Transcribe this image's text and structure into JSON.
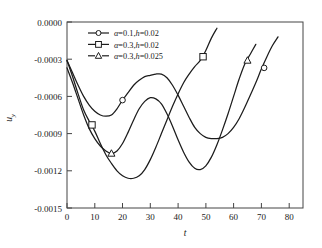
{
  "chart_data": {
    "type": "line",
    "title": "",
    "xlabel": "t",
    "ylabel": "u_y",
    "xlim": [
      0,
      85
    ],
    "ylim": [
      -0.0015,
      0.0
    ],
    "grid": false,
    "legend_position": "top-left-inside",
    "x_ticks": [
      0,
      10,
      20,
      30,
      40,
      50,
      60,
      70,
      80
    ],
    "x_tick_labels": [
      "0",
      "10",
      "20",
      "30",
      "40",
      "50",
      "60",
      "70",
      "80"
    ],
    "y_ticks": [
      0.0,
      -0.0003,
      -0.0006,
      -0.0009,
      -0.0012,
      -0.0015
    ],
    "y_tick_labels": [
      "0.0000",
      "-0.0003",
      "-0.0006",
      "-0.0009",
      "-0.0012",
      "-0.0015"
    ],
    "series": [
      {
        "name": "alpha=0.1,h=0.02",
        "label_alpha": "α",
        "label_alpha_value": "=0.1,",
        "label_h": "h",
        "label_h_value": "=0.02",
        "marker": "circle",
        "linestyle": "solid",
        "color": "#1c1c1c",
        "x": [
          0,
          2,
          4,
          6,
          8,
          10,
          12,
          14,
          16,
          18,
          20,
          22,
          24,
          26,
          28,
          30,
          32,
          34,
          36,
          38,
          40,
          42,
          44,
          46,
          48,
          50,
          52,
          54,
          56,
          58,
          60,
          62,
          64,
          66,
          68,
          70,
          72,
          74,
          76
        ],
        "y": [
          -0.00031,
          -0.00041,
          -0.00051,
          -0.0006,
          -0.00067,
          -0.00072,
          -0.00075,
          -0.00076,
          -0.00075,
          -0.0007,
          -0.00063,
          -0.00057,
          -0.00051,
          -0.00047,
          -0.00044,
          -0.00043,
          -0.00042,
          -0.00042,
          -0.00045,
          -0.00051,
          -0.00059,
          -0.00068,
          -0.00077,
          -0.00085,
          -0.0009,
          -0.00093,
          -0.00094,
          -0.00094,
          -0.00093,
          -0.0009,
          -0.00085,
          -0.00078,
          -0.00069,
          -0.00059,
          -0.00049,
          -0.00038,
          -0.00028,
          -0.00019,
          -0.00012
        ],
        "markers_x": [
          20,
          71
        ],
        "markers_y": [
          -0.00063,
          -0.00037
        ]
      },
      {
        "name": "alpha=0.3,h=0.02",
        "label_alpha": "α",
        "label_alpha_value": "=0.3,",
        "label_h": "h",
        "label_h_value": "=0.02",
        "marker": "square",
        "linestyle": "solid",
        "color": "#1c1c1c",
        "x": [
          0,
          2,
          4,
          6,
          8,
          10,
          12,
          14,
          16,
          18,
          20,
          22,
          24,
          26,
          28,
          30,
          32,
          34,
          36,
          38,
          40,
          42,
          44,
          46,
          48,
          50,
          52,
          54
        ],
        "y": [
          -0.00031,
          -0.00044,
          -0.00058,
          -0.00071,
          -0.0008,
          -0.00088,
          -0.00098,
          -0.00107,
          -0.00114,
          -0.0012,
          -0.00124,
          -0.00126,
          -0.00126,
          -0.00124,
          -0.00119,
          -0.00111,
          -0.00101,
          -0.0009,
          -0.00079,
          -0.00068,
          -0.00058,
          -0.00049,
          -0.00042,
          -0.00036,
          -0.00031,
          -0.00023,
          -0.00013,
          -5e-05
        ],
        "markers_x": [
          9,
          49
        ],
        "markers_y": [
          -0.00083,
          -0.00028
        ]
      },
      {
        "name": "alpha=0.3,h=0.025",
        "label_alpha": "α",
        "label_alpha_value": "=0.3,",
        "label_h": "h",
        "label_h_value": "=0.025",
        "marker": "triangle",
        "linestyle": "dashed",
        "color": "#1c1c1c",
        "x": [
          0,
          2,
          4,
          6,
          8,
          10,
          12,
          14,
          16,
          18,
          20,
          22,
          24,
          26,
          28,
          30,
          32,
          34,
          36,
          38,
          40,
          42,
          44,
          46,
          48,
          50,
          52,
          54,
          56,
          58,
          60,
          62,
          64,
          66,
          68
        ],
        "y": [
          -0.00037,
          -0.00049,
          -0.00062,
          -0.00075,
          -0.00086,
          -0.00094,
          -0.001,
          -0.00104,
          -0.00106,
          -0.00104,
          -0.00098,
          -0.00089,
          -0.00079,
          -0.0007,
          -0.00064,
          -0.00061,
          -0.00062,
          -0.00066,
          -0.00074,
          -0.00084,
          -0.00095,
          -0.00105,
          -0.00113,
          -0.00118,
          -0.00119,
          -0.00116,
          -0.00109,
          -0.00099,
          -0.00087,
          -0.00074,
          -0.0006,
          -0.00046,
          -0.00034,
          -0.00026,
          -0.00018
        ],
        "markers_x": [
          16,
          65
        ],
        "markers_y": [
          -0.00106,
          -0.00031
        ]
      }
    ]
  }
}
